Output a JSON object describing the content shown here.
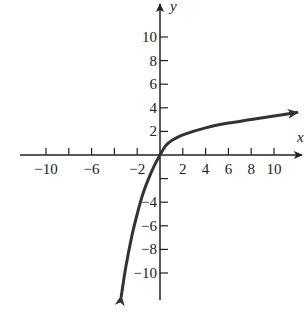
{
  "chart_data": {
    "type": "line",
    "title": "",
    "xlabel": "x",
    "ylabel": "y",
    "xlim": [
      -12,
      12
    ],
    "ylim": [
      -12,
      12
    ],
    "grid": false,
    "x_ticks": [
      -10,
      -8,
      -6,
      -4,
      -2,
      2,
      4,
      6,
      8,
      10
    ],
    "x_tick_labels": [
      "-10",
      "-6",
      "-2",
      "2",
      "4",
      "6",
      "8",
      "10"
    ],
    "y_ticks": [
      10,
      8,
      6,
      4,
      2,
      -2,
      -4,
      -6,
      -8,
      -10
    ],
    "y_tick_labels": [
      "10",
      "8",
      "6",
      "4",
      "2",
      "-4",
      "-6",
      "-8",
      "-10"
    ],
    "series": [
      {
        "name": "curve",
        "color": "#333333",
        "arrows": "both",
        "x": [
          -3.4,
          -3.0,
          -2.5,
          -2.0,
          -1.5,
          -1.0,
          -0.5,
          0,
          0.5,
          1,
          2,
          4,
          6,
          8,
          10,
          12
        ],
        "y": [
          -12.0,
          -9.5,
          -7.0,
          -5.0,
          -3.3,
          -2.0,
          -0.9,
          0,
          0.8,
          1.2,
          1.7,
          2.3,
          2.7,
          3.0,
          3.3,
          3.6
        ]
      }
    ]
  },
  "labels": {
    "x_axis": "x",
    "y_axis": "y"
  },
  "colors": {
    "axis": "#222222",
    "curve": "#333333"
  }
}
